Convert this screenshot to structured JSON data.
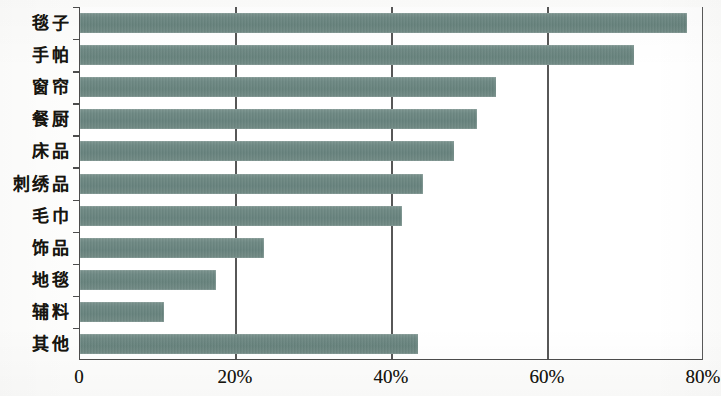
{
  "chart_data": {
    "type": "bar",
    "orientation": "horizontal",
    "title": "",
    "subtitle": "",
    "xlabel": "",
    "ylabel": "",
    "categories": [
      "毯子",
      "手帕",
      "窗帘",
      "餐厨",
      "床品",
      "刺绣品",
      "毛巾",
      "饰品",
      "地毯",
      "辅料",
      "其他"
    ],
    "values": [
      77.8,
      71.0,
      53.3,
      50.9,
      48.0,
      44.0,
      41.3,
      23.6,
      17.4,
      10.8,
      43.3
    ],
    "xlim": [
      0,
      80
    ],
    "ylim_categories": 11,
    "xticks": [
      0,
      20,
      40,
      60,
      80
    ],
    "xtick_labels": [
      "0",
      "20%",
      "40%",
      "60%",
      "80%"
    ],
    "grid": "vertical",
    "legend": "none",
    "series": [
      {
        "name": "占比",
        "values": [
          77.8,
          71.0,
          53.3,
          50.9,
          48.0,
          44.0,
          41.3,
          23.6,
          17.4,
          10.8,
          43.3
        ]
      }
    ],
    "annotations": [],
    "colors": {
      "bar": "#6d8883",
      "axis": "#4c4c4c",
      "gridline": "#575757",
      "background": "#ffffff",
      "text": "#17150f"
    }
  }
}
